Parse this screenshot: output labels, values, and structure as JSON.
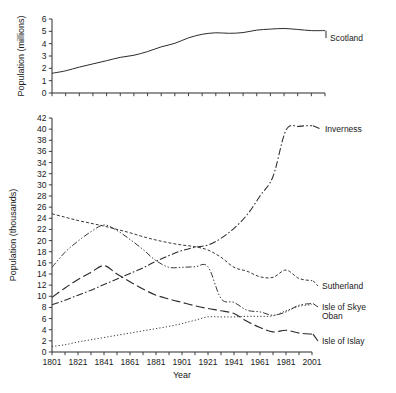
{
  "chart_data": [
    {
      "type": "line",
      "title": "",
      "xlabel": "",
      "ylabel": "Population (millions)",
      "xlim": [
        1801,
        2001
      ],
      "ylim": [
        0,
        6
      ],
      "yticks": [
        0,
        1,
        2,
        3,
        4,
        5,
        6
      ],
      "xticks": [],
      "xtick_labels": [],
      "grid": false,
      "legend_position": "right-inline",
      "x": [
        1801,
        1811,
        1821,
        1831,
        1841,
        1851,
        1861,
        1871,
        1881,
        1891,
        1901,
        1911,
        1921,
        1931,
        1941,
        1951,
        1961,
        1971,
        1981,
        1991,
        2001
      ],
      "series": [
        {
          "name": "Scotland",
          "style": "solid",
          "values": [
            1.6,
            1.8,
            2.1,
            2.36,
            2.62,
            2.89,
            3.06,
            3.36,
            3.74,
            4.03,
            4.47,
            4.76,
            4.88,
            4.84,
            4.9,
            5.1,
            5.18,
            5.23,
            5.15,
            5.06,
            5.06
          ]
        }
      ]
    },
    {
      "type": "line",
      "title": "",
      "xlabel": "Year",
      "ylabel": "Population (thousands)",
      "xlim": [
        1801,
        2001
      ],
      "ylim": [
        0,
        42
      ],
      "yticks": [
        0,
        2,
        4,
        6,
        8,
        10,
        12,
        14,
        16,
        18,
        20,
        22,
        24,
        26,
        28,
        30,
        32,
        34,
        36,
        38,
        40,
        42
      ],
      "xticks": [
        1801,
        1811,
        1821,
        1831,
        1841,
        1851,
        1861,
        1871,
        1881,
        1891,
        1901,
        1911,
        1921,
        1931,
        1941,
        1951,
        1961,
        1971,
        1981,
        1991,
        2001
      ],
      "xtick_labels": [
        "1801",
        "",
        "1821",
        "",
        "1841",
        "",
        "1861",
        "",
        "1881",
        "",
        "1901",
        "",
        "1921",
        "",
        "1941",
        "",
        "1961",
        "",
        "1981",
        "",
        "2001"
      ],
      "grid": false,
      "legend_position": "right-inline",
      "x": [
        1801,
        1811,
        1821,
        1831,
        1841,
        1851,
        1861,
        1871,
        1881,
        1891,
        1901,
        1911,
        1921,
        1931,
        1941,
        1951,
        1961,
        1971,
        1981,
        1991,
        2001
      ],
      "series": [
        {
          "name": "Inverness",
          "style": "dash-dot",
          "values": [
            8.5,
            9.3,
            10.2,
            11.1,
            12.1,
            13.1,
            14.1,
            15.1,
            16.3,
            17.3,
            18.2,
            18.8,
            19.2,
            20.4,
            22.2,
            24.6,
            28.0,
            31.5,
            39.8,
            40.5,
            40.6
          ]
        },
        {
          "name": "Sutherland",
          "style": "dashed-fine",
          "values": [
            24.8,
            24.2,
            23.6,
            23.1,
            22.6,
            22.0,
            21.4,
            20.7,
            20.1,
            19.6,
            19.2,
            18.9,
            18.3,
            17.0,
            15.2,
            14.5,
            13.5,
            13.4,
            14.7,
            13.2,
            12.8
          ]
        },
        {
          "name": "Isle of Skye",
          "style": "dash-dot-dot",
          "values": [
            15.2,
            17.9,
            19.9,
            21.6,
            22.8,
            21.8,
            20.2,
            18.4,
            16.4,
            15.2,
            15.2,
            15.3,
            15.3,
            9.6,
            8.9,
            7.5,
            7.2,
            6.6,
            7.2,
            8.4,
            8.7
          ]
        },
        {
          "name": "Oban",
          "style": "dotted",
          "values": [
            1.0,
            1.3,
            1.8,
            2.2,
            2.6,
            3.0,
            3.4,
            3.8,
            4.2,
            4.6,
            5.1,
            5.7,
            6.3,
            6.3,
            6.3,
            6.4,
            6.4,
            6.5,
            7.4,
            8.2,
            8.5
          ]
        },
        {
          "name": "Isle of Islay",
          "style": "long-dash",
          "values": [
            9.8,
            11.5,
            13.0,
            14.3,
            15.5,
            14.0,
            12.6,
            11.3,
            10.2,
            9.5,
            8.9,
            8.3,
            7.8,
            7.4,
            6.9,
            5.5,
            4.4,
            3.6,
            3.9,
            3.4,
            3.2
          ]
        }
      ]
    }
  ],
  "labels": {
    "top_ylabel": "Population (millions)",
    "bottom_ylabel": "Population  (thousands)",
    "xlabel": "Year",
    "scotland": "Scotland",
    "inverness": "Inverness",
    "sutherland": "Sutherland",
    "isle_of_skye": "Isle of Skye",
    "oban": "Oban",
    "isle_of_islay": "Isle of Islay"
  },
  "colors": {
    "ink": "#2b2b2b",
    "background": "#ffffff"
  }
}
